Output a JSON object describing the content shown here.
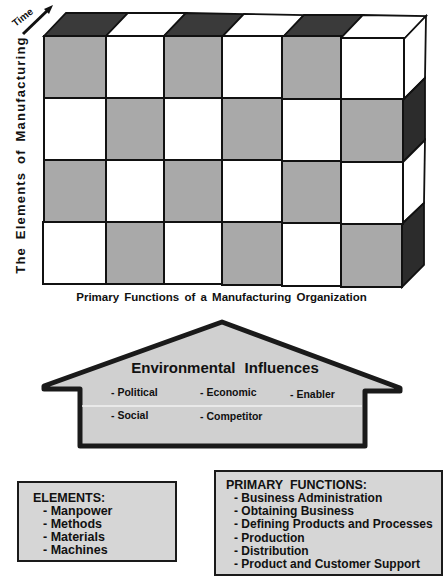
{
  "diagram": {
    "time_axis_label": "Time",
    "vertical_axis_label": "The Elements of Manufacturing",
    "horizontal_axis_label": "Primary Functions of a Manufacturing Organization",
    "grid": {
      "rows": 4,
      "columns": 6,
      "pattern": "checkerboard"
    },
    "colors": {
      "gray_cell": "#a9a9a9",
      "white_cell": "#ffffff",
      "dark_face": "#3a3a3a",
      "outline": "#111111",
      "panel_fill": "#d6d6d6"
    }
  },
  "environment": {
    "title": "Environmental Influences",
    "items": [
      "- Political",
      "- Economic",
      "- Enabler",
      "- Social",
      "- Competitor"
    ]
  },
  "elements_box": {
    "title": "ELEMENTS:",
    "items": [
      "- Manpower",
      "- Methods",
      "- Materials",
      "- Machines"
    ]
  },
  "functions_box": {
    "title": "PRIMARY  FUNCTIONS:",
    "items": [
      "- Business Administration",
      "- Obtaining Business",
      "- Defining Products and Processes",
      "- Production",
      "- Distribution",
      "- Product and Customer Support"
    ]
  }
}
